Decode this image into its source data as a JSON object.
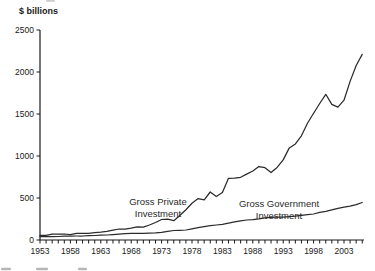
{
  "page": {
    "background": "#ffffff"
  },
  "chart_data": {
    "type": "line",
    "title": "",
    "unit_label": "$ billions",
    "xlabel": "",
    "ylabel": "$ billions",
    "xlim": [
      1953,
      2006
    ],
    "ylim": [
      0,
      2500
    ],
    "grid": false,
    "legend": "inline-annotations",
    "axis_color": "#1a1a1a",
    "line_color": "#2b2b2b",
    "y_ticks": [
      0,
      500,
      1000,
      1500,
      2000,
      2500
    ],
    "y_tick_labels": [
      "0",
      "500",
      "1000",
      "1500",
      "2000",
      "2500"
    ],
    "x_tick_years": [
      1953,
      1958,
      1963,
      1968,
      1973,
      1978,
      1983,
      1988,
      1993,
      1998,
      2003
    ],
    "x_minor_tick_every_year": true,
    "years_start": 1953,
    "years_end": 2006,
    "series": [
      {
        "name": "Gross Private Investment",
        "label_lines": [
          "Gross Private",
          "Investment"
        ],
        "label_anchor": {
          "x": 158,
          "y": 205
        },
        "values": [
          56,
          55,
          69,
          72,
          71,
          64,
          78,
          79,
          78,
          88,
          93,
          102,
          118,
          131,
          128,
          141,
          156,
          152,
          178,
          208,
          244,
          249,
          230,
          292,
          361,
          438,
          493,
          479,
          572,
          517,
          564,
          735,
          736,
          747,
          785,
          821,
          874,
          861,
          802,
          864,
          953,
          1097,
          1144,
          1240,
          1389,
          1509,
          1625,
          1735,
          1614,
          1582,
          1664,
          1888,
          2077,
          2209
        ]
      },
      {
        "name": "Gross Government Investment",
        "label_lines": [
          "Gross Government",
          "Investment"
        ],
        "label_anchor": {
          "x": 279,
          "y": 207
        },
        "values": [
          40,
          41,
          40,
          42,
          45,
          47,
          48,
          48,
          51,
          54,
          57,
          60,
          64,
          70,
          75,
          79,
          79,
          80,
          82,
          85,
          92,
          103,
          113,
          116,
          119,
          133,
          146,
          160,
          170,
          178,
          186,
          200,
          216,
          229,
          238,
          243,
          252,
          264,
          269,
          271,
          272,
          278,
          285,
          293,
          302,
          310,
          328,
          342,
          358,
          376,
          390,
          404,
          422,
          446
        ]
      }
    ]
  },
  "footer": {
    "note": "cut-off text fragments along bottom edge",
    "cutoff_fragments": [
      {
        "x": 1,
        "w": 10
      },
      {
        "x": 36,
        "w": 12
      },
      {
        "x": 78,
        "w": 9
      }
    ]
  },
  "artifacts": {
    "top_smudge": {
      "x": 46,
      "w": 9
    }
  }
}
